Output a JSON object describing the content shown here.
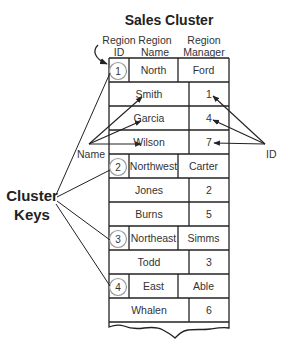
{
  "title": "Sales Cluster",
  "headers": {
    "region_id": [
      "Region",
      "ID"
    ],
    "region_name": [
      "Region",
      "Name"
    ],
    "region_manager": [
      "Region",
      "Manager"
    ]
  },
  "labels": {
    "name": "Name",
    "id": "ID",
    "cluster_keys": [
      "Cluster",
      "Keys"
    ]
  },
  "clusters": [
    {
      "id": "1",
      "name": "North",
      "manager": "Ford",
      "employees": [
        {
          "name": "Smith",
          "id": "1"
        },
        {
          "name": "Garcia",
          "id": "4"
        },
        {
          "name": "Wilson",
          "id": "7"
        }
      ]
    },
    {
      "id": "2",
      "name": "Northwest",
      "manager": "Carter",
      "employees": [
        {
          "name": "Jones",
          "id": "2"
        },
        {
          "name": "Burns",
          "id": "5"
        }
      ]
    },
    {
      "id": "3",
      "name": "Northeast",
      "manager": "Simms",
      "employees": [
        {
          "name": "Todd",
          "id": "3"
        }
      ]
    },
    {
      "id": "4",
      "name": "East",
      "manager": "Able",
      "employees": [
        {
          "name": "Whalen",
          "id": "6"
        }
      ]
    }
  ]
}
